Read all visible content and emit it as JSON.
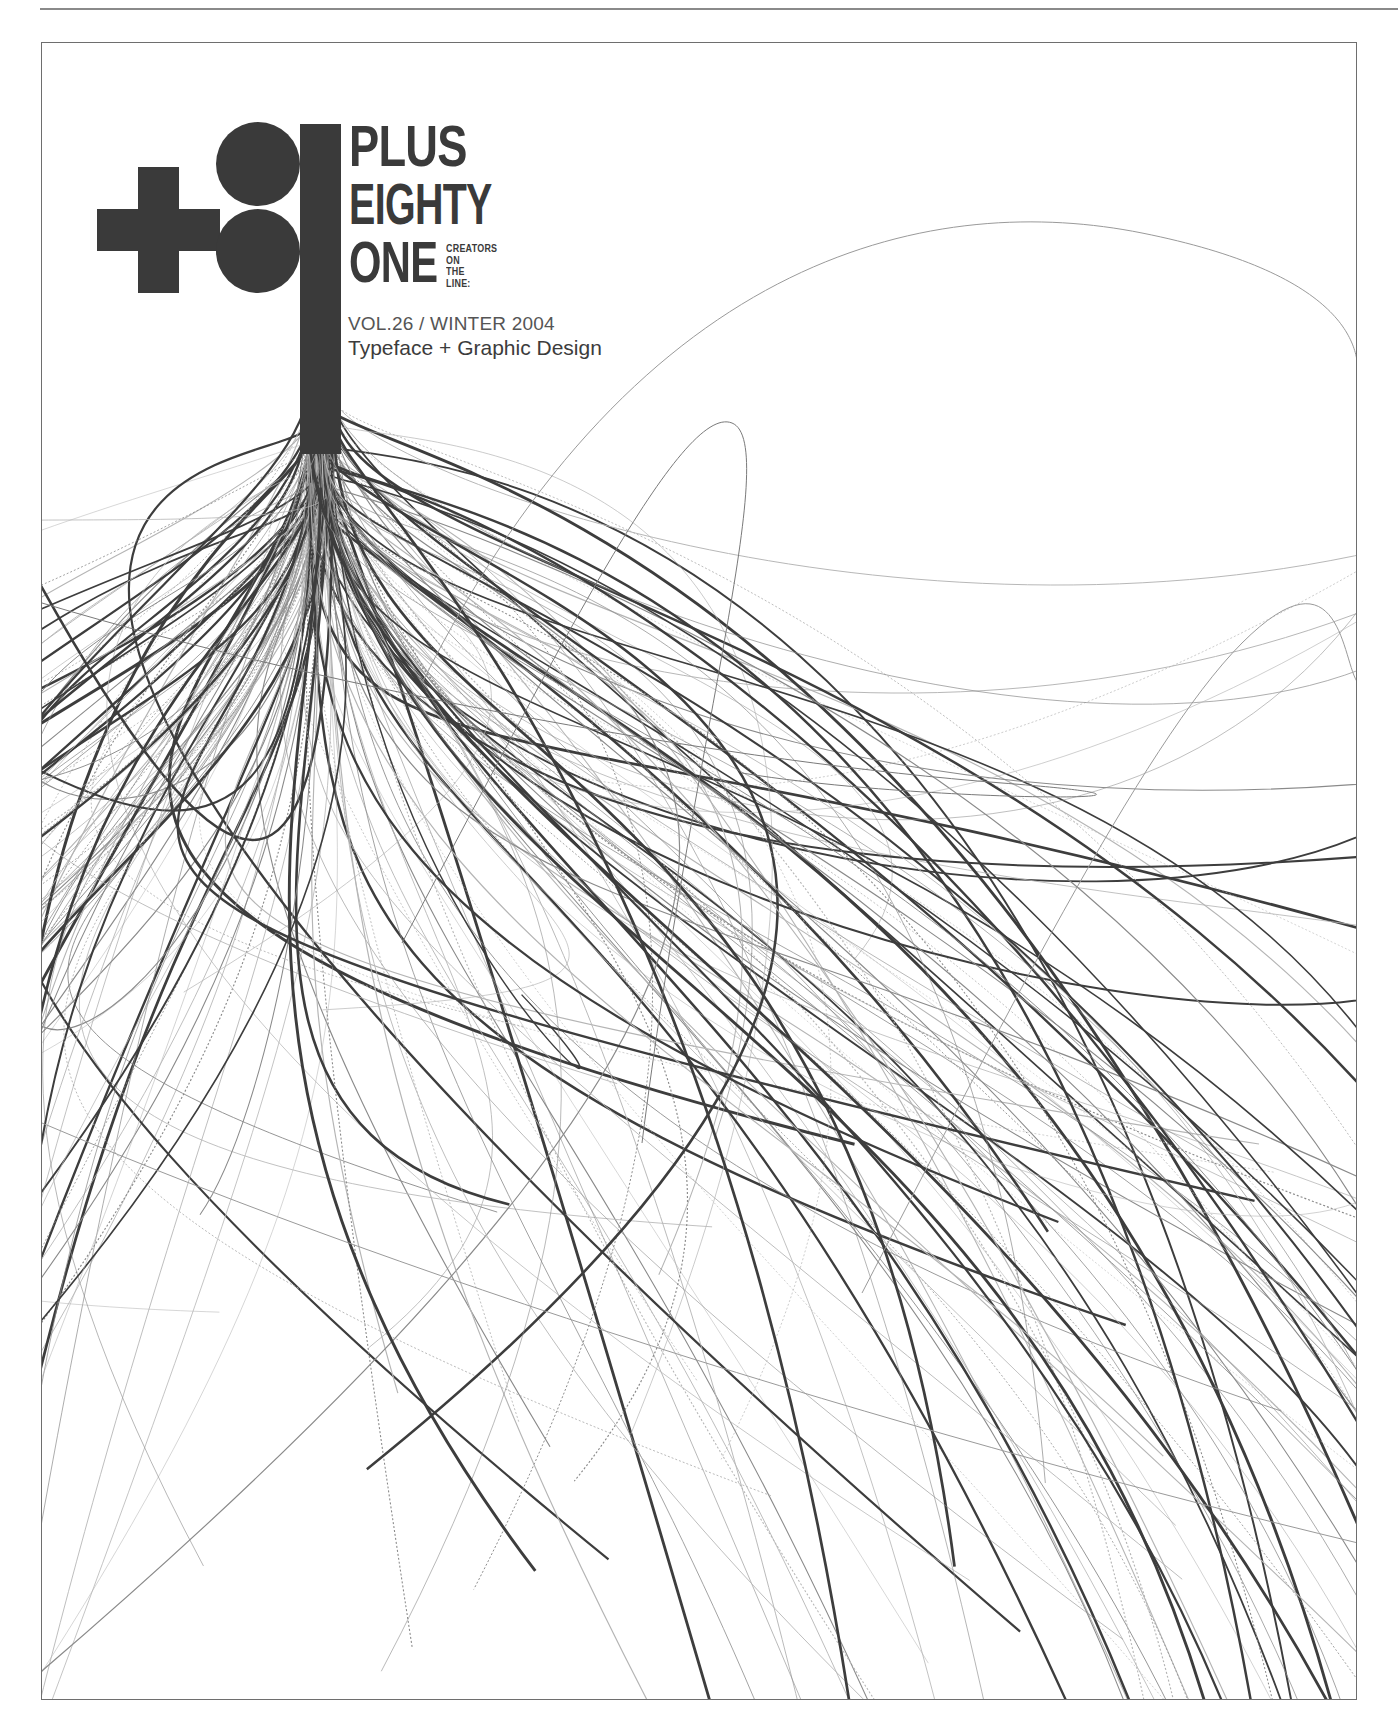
{
  "cover": {
    "masthead": {
      "line1": "PLUS",
      "line2": "EIGHTY",
      "line3": "ONE",
      "tagline": [
        "CREATORS",
        "ON",
        "THE",
        "LINE:"
      ],
      "logo_symbol": "+81"
    },
    "volume": "VOL.26 / WINTER 2004",
    "issue_title": "Typeface + Graphic Design",
    "colors": {
      "ink": "#3a3a3a",
      "background": "#ffffff",
      "frame": "#6e6e6e"
    },
    "artwork": "line-bundle-icon"
  }
}
